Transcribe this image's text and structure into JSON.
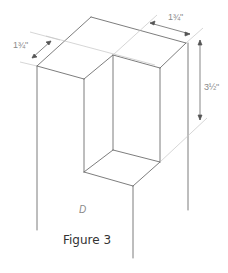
{
  "figure": {
    "caption": "Figure 3",
    "part_label": "D",
    "dimensions": {
      "left_width": "1¾\"",
      "right_width": "1¾\"",
      "height": "3½\""
    },
    "colors": {
      "edge": "#6e6e6e",
      "construction": "#c4c4c4",
      "dim_text": "#8a8a8a",
      "caption_text": "#333333"
    }
  }
}
